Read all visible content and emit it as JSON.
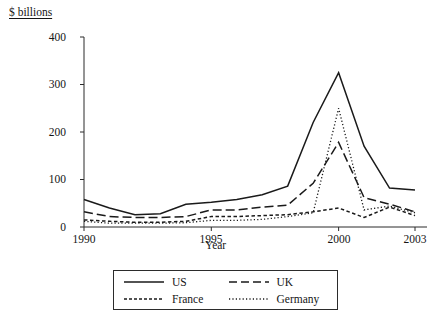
{
  "chart_data": {
    "type": "line",
    "title": "",
    "ylabel": "$ billions",
    "xlabel": "Year",
    "x": [
      1990,
      1991,
      1992,
      1993,
      1994,
      1995,
      1996,
      1997,
      1998,
      1999,
      2000,
      2001,
      2002,
      2003
    ],
    "xlim": [
      1990,
      2003
    ],
    "ylim": [
      0,
      400
    ],
    "yticks": [
      0,
      100,
      200,
      300,
      400
    ],
    "xticks": [
      1990,
      1995,
      2000,
      2003
    ],
    "grid": false,
    "legend_position": "bottom-center",
    "series": [
      {
        "name": "US",
        "style": "solid",
        "values": [
          58,
          40,
          26,
          28,
          48,
          52,
          58,
          68,
          86,
          220,
          325,
          170,
          82,
          78
        ]
      },
      {
        "name": "UK",
        "style": "long-dash",
        "values": [
          32,
          22,
          20,
          20,
          22,
          36,
          36,
          42,
          46,
          92,
          178,
          62,
          48,
          32
        ]
      },
      {
        "name": "France",
        "style": "short-dash",
        "values": [
          15,
          12,
          10,
          10,
          12,
          22,
          22,
          24,
          26,
          32,
          40,
          20,
          42,
          24
        ]
      },
      {
        "name": "Germany",
        "style": "dotted",
        "values": [
          12,
          8,
          8,
          8,
          9,
          14,
          14,
          16,
          22,
          30,
          250,
          36,
          44,
          30
        ]
      }
    ]
  },
  "axis": {
    "y_tick_labels": [
      "400",
      "300",
      "200",
      "100",
      "0"
    ],
    "x_tick_labels": [
      "1990",
      "1995",
      "2000",
      "2003"
    ]
  },
  "legend": {
    "entries": [
      {
        "label": "US",
        "style": "solid"
      },
      {
        "label": "UK",
        "style": "long-dash"
      },
      {
        "label": "France",
        "style": "short-dash"
      },
      {
        "label": "Germany",
        "style": "dotted"
      }
    ]
  }
}
